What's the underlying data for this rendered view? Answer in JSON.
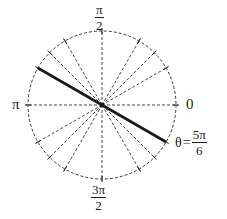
{
  "diagram": {
    "type": "polar-angle-diagram",
    "center": {
      "x": 102,
      "y": 105
    },
    "radius": 74,
    "colors": {
      "ink": "#1a1a1a",
      "dashed": "#333333",
      "background": "#ffffff"
    },
    "labels": {
      "top": {
        "numerator": "π",
        "denominator": "2"
      },
      "left": "π",
      "right": "0",
      "bottom": {
        "numerator": "3π",
        "denominator": "2"
      },
      "theta": {
        "symbol": "θ",
        "equals": "=",
        "numerator": "5π",
        "denominator": "6"
      }
    },
    "dashed_angles_deg": [
      0,
      30,
      45,
      60,
      90,
      120,
      135,
      180,
      210,
      225,
      240,
      270,
      300,
      315
    ],
    "highlighted_line": {
      "angle_label": "θ = 5π/6",
      "angles_deg": [
        150,
        330
      ]
    },
    "tick_angles_deg": [
      0,
      30,
      45,
      60,
      90,
      120,
      135,
      150,
      180,
      210,
      225,
      240,
      270,
      300,
      315,
      330
    ]
  }
}
